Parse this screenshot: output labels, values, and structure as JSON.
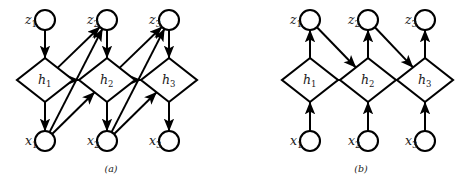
{
  "figure": {
    "background_color": "#ffffff",
    "stroke_color": "#000000",
    "panels": [
      {
        "id": "a",
        "caption": "(a)",
        "caption_x": 111,
        "caption_y": 172,
        "node_radius": 10,
        "diamond_rx": 28,
        "diamond_ry": 22,
        "columns": [
          45,
          107,
          169
        ],
        "rows": {
          "z": 20,
          "h": 80,
          "x": 141
        },
        "nodes": [
          {
            "name": "z1",
            "base": "z",
            "sub": "1",
            "shape": "circle",
            "col": 0,
            "row": "z",
            "label_dx": -20,
            "label_dy": 4
          },
          {
            "name": "z2",
            "base": "z",
            "sub": "2",
            "shape": "circle",
            "col": 1,
            "row": "z",
            "label_dx": -20,
            "label_dy": 4
          },
          {
            "name": "z3",
            "base": "z",
            "sub": "3",
            "shape": "circle",
            "col": 2,
            "row": "z",
            "label_dx": -20,
            "label_dy": 4
          },
          {
            "name": "h1",
            "base": "h",
            "sub": "1",
            "shape": "diamond",
            "col": 0,
            "row": "h",
            "label_dx": -7,
            "label_dy": 4
          },
          {
            "name": "h2",
            "base": "h",
            "sub": "2",
            "shape": "diamond",
            "col": 1,
            "row": "h",
            "label_dx": -7,
            "label_dy": 4
          },
          {
            "name": "h3",
            "base": "h",
            "sub": "3",
            "shape": "diamond",
            "col": 2,
            "row": "h",
            "label_dx": -7,
            "label_dy": 4
          },
          {
            "name": "x1",
            "base": "x",
            "sub": "1",
            "shape": "circle",
            "col": 0,
            "row": "x",
            "label_dx": -20,
            "label_dy": 4
          },
          {
            "name": "x2",
            "base": "x",
            "sub": "2",
            "shape": "circle",
            "col": 1,
            "row": "x",
            "label_dx": -20,
            "label_dy": 4
          },
          {
            "name": "x3",
            "base": "x",
            "sub": "3",
            "shape": "circle",
            "col": 2,
            "row": "x",
            "label_dx": -20,
            "label_dy": 4
          }
        ],
        "edges": [
          {
            "from": "z1",
            "to": "h1"
          },
          {
            "from": "z2",
            "to": "h2"
          },
          {
            "from": "z3",
            "to": "h3"
          },
          {
            "from": "h1",
            "to": "x1"
          },
          {
            "from": "h2",
            "to": "x2"
          },
          {
            "from": "h3",
            "to": "x3"
          },
          {
            "from": "h1",
            "to": "h2"
          },
          {
            "from": "h2",
            "to": "h3"
          },
          {
            "from": "h1",
            "to": "z2"
          },
          {
            "from": "h2",
            "to": "z3"
          },
          {
            "from": "x1",
            "to": "z2"
          },
          {
            "from": "x2",
            "to": "z3"
          },
          {
            "from": "x1",
            "to": "h2"
          },
          {
            "from": "x2",
            "to": "h3"
          }
        ]
      },
      {
        "id": "b",
        "caption": "(b)",
        "caption_x": 361,
        "caption_y": 172,
        "node_radius": 10,
        "diamond_rx": 28,
        "diamond_ry": 22,
        "columns": [
          310,
          368,
          425
        ],
        "rows": {
          "z": 20,
          "h": 80,
          "x": 141
        },
        "nodes": [
          {
            "name": "z1",
            "base": "z",
            "sub": "1",
            "shape": "circle",
            "col": 0,
            "row": "z",
            "label_dx": -20,
            "label_dy": 4
          },
          {
            "name": "z2",
            "base": "z",
            "sub": "2",
            "shape": "circle",
            "col": 1,
            "row": "z",
            "label_dx": -20,
            "label_dy": 4
          },
          {
            "name": "z3",
            "base": "z",
            "sub": "3",
            "shape": "circle",
            "col": 2,
            "row": "z",
            "label_dx": -20,
            "label_dy": 4
          },
          {
            "name": "h1",
            "base": "h",
            "sub": "1",
            "shape": "diamond",
            "col": 0,
            "row": "h",
            "label_dx": -7,
            "label_dy": 4
          },
          {
            "name": "h2",
            "base": "h",
            "sub": "2",
            "shape": "diamond",
            "col": 1,
            "row": "h",
            "label_dx": -7,
            "label_dy": 4
          },
          {
            "name": "h3",
            "base": "h",
            "sub": "3",
            "shape": "diamond",
            "col": 2,
            "row": "h",
            "label_dx": -7,
            "label_dy": 4
          },
          {
            "name": "x1",
            "base": "x",
            "sub": "1",
            "shape": "circle",
            "col": 0,
            "row": "x",
            "label_dx": -20,
            "label_dy": 4
          },
          {
            "name": "x2",
            "base": "x",
            "sub": "2",
            "shape": "circle",
            "col": 1,
            "row": "x",
            "label_dx": -20,
            "label_dy": 4
          },
          {
            "name": "x3",
            "base": "x",
            "sub": "3",
            "shape": "circle",
            "col": 2,
            "row": "x",
            "label_dx": -20,
            "label_dy": 4
          }
        ],
        "edges": [
          {
            "from": "h1",
            "to": "z1"
          },
          {
            "from": "h2",
            "to": "z2"
          },
          {
            "from": "h3",
            "to": "z3"
          },
          {
            "from": "x1",
            "to": "h1"
          },
          {
            "from": "x2",
            "to": "h2"
          },
          {
            "from": "x3",
            "to": "h3"
          },
          {
            "from": "h1",
            "to": "h2"
          },
          {
            "from": "h2",
            "to": "h3"
          },
          {
            "from": "z1",
            "to": "h2"
          },
          {
            "from": "z2",
            "to": "h3"
          }
        ]
      }
    ]
  }
}
